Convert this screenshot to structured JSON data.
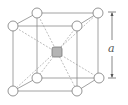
{
  "diagram": {
    "dimension_label": "a",
    "colors": {
      "edge": "#8a8a8a",
      "corner_atom_fill": "#ffffff",
      "center_atom_fill": "#b4b4b4",
      "label": "#555555"
    },
    "atoms": {
      "corner_count": 8,
      "center_count": 1
    }
  }
}
